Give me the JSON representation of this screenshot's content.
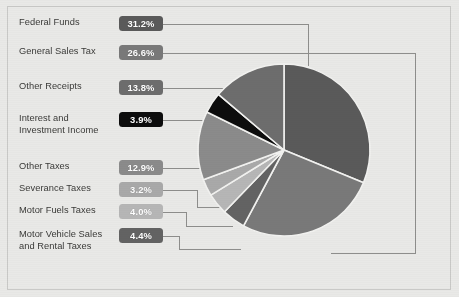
{
  "chart_data": {
    "type": "pie",
    "title": "",
    "xlabel": "",
    "ylabel": "",
    "legend_position": "left",
    "grid": false,
    "units": "percent",
    "total": 100.0,
    "categories": [
      "Federal Funds",
      "General Sales Tax",
      "Other Receipts",
      "Interest and\nInvestment Income",
      "Other Taxes",
      "Severance Taxes",
      "Motor Fuels Taxes",
      "Motor Vehicle Sales\nand Rental Taxes"
    ],
    "values": [
      31.2,
      26.6,
      13.8,
      3.9,
      12.9,
      3.2,
      4.0,
      4.4
    ],
    "value_labels": [
      "31.2%",
      "26.6%",
      "13.8%",
      "3.9%",
      "12.9%",
      "3.2%",
      "4.0%",
      "4.4%"
    ],
    "colors": [
      "#5a5a5a",
      "#797979",
      "#6d6d6d",
      "#0d0d0d",
      "#8b8b8b",
      "#a9a9a9",
      "#b6b6b6",
      "#636363"
    ],
    "slices": [
      {
        "label": "Federal Funds",
        "value": 31.2,
        "value_label": "31.2%",
        "color": "#5a5a5a"
      },
      {
        "label": "General Sales Tax",
        "value": 26.6,
        "value_label": "26.6%",
        "color": "#797979"
      },
      {
        "label": "Motor Vehicle Sales and Rental Taxes",
        "value": 4.4,
        "value_label": "4.4%",
        "color": "#636363"
      },
      {
        "label": "Motor Fuels Taxes",
        "value": 4.0,
        "value_label": "4.0%",
        "color": "#b6b6b6"
      },
      {
        "label": "Severance Taxes",
        "value": 3.2,
        "value_label": "3.2%",
        "color": "#a9a9a9"
      },
      {
        "label": "Other Taxes",
        "value": 12.9,
        "value_label": "12.9%",
        "color": "#8b8b8b"
      },
      {
        "label": "Interest and Investment Income",
        "value": 3.9,
        "value_label": "3.9%",
        "color": "#0d0d0d"
      },
      {
        "label": "Other Receipts",
        "value": 13.8,
        "value_label": "13.8%",
        "color": "#6d6d6d"
      }
    ]
  },
  "legend": {
    "rows": [
      {
        "label": "Federal Funds",
        "value_label": "31.2%",
        "color": "#5a5a5a"
      },
      {
        "label": "General Sales Tax",
        "value_label": "26.6%",
        "color": "#797979"
      },
      {
        "label": "Other Receipts",
        "value_label": "13.8%",
        "color": "#6d6d6d"
      },
      {
        "label": "Interest and\nInvestment Income",
        "value_label": "3.9%",
        "color": "#0d0d0d"
      },
      {
        "label": "Other Taxes",
        "value_label": "12.9%",
        "color": "#8b8b8b"
      },
      {
        "label": "Severance Taxes",
        "value_label": "3.2%",
        "color": "#a9a9a9"
      },
      {
        "label": "Motor Fuels Taxes",
        "value_label": "4.0%",
        "color": "#b6b6b6"
      },
      {
        "label": "Motor Vehicle Sales\nand Rental Taxes",
        "value_label": "4.4%",
        "color": "#636363"
      }
    ]
  },
  "style": {
    "background": "#e9e9e7",
    "frame_border": "#c9c9c7",
    "leader_line": "#8e8e8c",
    "slice_divider": "#f2f2f0",
    "label_text": "#3a3a38"
  }
}
